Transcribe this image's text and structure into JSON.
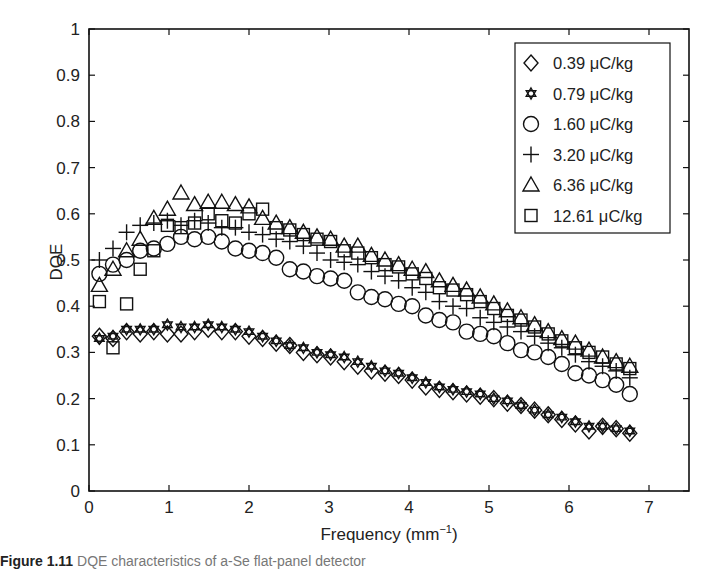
{
  "chart_data": {
    "type": "scatter",
    "title": "",
    "xlabel": "Frequency (mm",
    "xlabel_sup": "−1",
    "xlabel_close": ")",
    "ylabel": "DQE",
    "xlim": [
      0,
      7.5
    ],
    "ylim": [
      0,
      1
    ],
    "xticks": [
      0,
      1,
      2,
      3,
      4,
      5,
      6,
      7
    ],
    "yticks": [
      0,
      0.1,
      0.2,
      0.3,
      0.4,
      0.5,
      0.6,
      0.7,
      0.8,
      0.9,
      1
    ],
    "ytick_labels": [
      "0",
      "0.1",
      "0.2",
      "0.3",
      "0.4",
      "0.5",
      "0.6",
      "0.7",
      "0.8",
      "0.9",
      "1"
    ],
    "grid": false,
    "legend_position": "upper right",
    "x": [
      0.13,
      0.3,
      0.47,
      0.64,
      0.81,
      0.98,
      1.15,
      1.32,
      1.49,
      1.66,
      1.83,
      2.0,
      2.17,
      2.34,
      2.51,
      2.68,
      2.85,
      3.02,
      3.19,
      3.36,
      3.53,
      3.7,
      3.87,
      4.04,
      4.21,
      4.38,
      4.55,
      4.72,
      4.89,
      5.06,
      5.23,
      5.4,
      5.57,
      5.74,
      5.91,
      6.08,
      6.25,
      6.42,
      6.59,
      6.76
    ],
    "series": [
      {
        "name": "0.39 μC/kg",
        "marker": "diamond",
        "values": [
          0.335,
          0.33,
          0.345,
          0.34,
          0.345,
          0.34,
          0.34,
          0.345,
          0.35,
          0.345,
          0.345,
          0.335,
          0.33,
          0.32,
          0.315,
          0.3,
          0.295,
          0.29,
          0.28,
          0.27,
          0.26,
          0.255,
          0.25,
          0.24,
          0.225,
          0.22,
          0.215,
          0.21,
          0.205,
          0.2,
          0.19,
          0.185,
          0.175,
          0.165,
          0.155,
          0.145,
          0.13,
          0.14,
          0.135,
          0.125
        ]
      },
      {
        "name": "0.79 μC/kg",
        "marker": "star",
        "values": [
          0.33,
          0.335,
          0.35,
          0.35,
          0.35,
          0.36,
          0.355,
          0.355,
          0.36,
          0.355,
          0.35,
          0.345,
          0.335,
          0.325,
          0.315,
          0.31,
          0.3,
          0.295,
          0.29,
          0.28,
          0.27,
          0.26,
          0.255,
          0.245,
          0.235,
          0.225,
          0.22,
          0.215,
          0.21,
          0.2,
          0.195,
          0.185,
          0.175,
          0.165,
          0.16,
          0.15,
          0.14,
          0.14,
          0.135,
          0.13
        ]
      },
      {
        "name": "1.60 μC/kg",
        "marker": "circle",
        "values": [
          0.47,
          0.49,
          0.5,
          0.52,
          0.525,
          0.535,
          0.55,
          0.545,
          0.55,
          0.54,
          0.525,
          0.52,
          0.515,
          0.505,
          0.48,
          0.475,
          0.465,
          0.46,
          0.455,
          0.43,
          0.42,
          0.415,
          0.405,
          0.4,
          0.38,
          0.37,
          0.365,
          0.345,
          0.34,
          0.335,
          0.32,
          0.305,
          0.3,
          0.29,
          0.275,
          0.255,
          0.25,
          0.24,
          0.23,
          0.21
        ]
      },
      {
        "name": "3.20 μC/kg",
        "marker": "plus",
        "values": [
          0.5,
          0.525,
          0.56,
          0.575,
          0.58,
          0.585,
          0.575,
          0.585,
          0.58,
          0.57,
          0.57,
          0.56,
          0.555,
          0.545,
          0.54,
          0.53,
          0.515,
          0.5,
          0.495,
          0.49,
          0.475,
          0.465,
          0.455,
          0.44,
          0.43,
          0.41,
          0.4,
          0.395,
          0.375,
          0.365,
          0.355,
          0.345,
          0.335,
          0.32,
          0.31,
          0.295,
          0.28,
          0.27,
          0.26,
          0.245
        ]
      },
      {
        "name": "6.36 μC/kg",
        "marker": "triangle",
        "values": [
          0.445,
          0.48,
          0.52,
          0.545,
          0.59,
          0.61,
          0.645,
          0.62,
          0.625,
          0.625,
          0.62,
          0.615,
          0.59,
          0.58,
          0.57,
          0.56,
          0.55,
          0.545,
          0.53,
          0.53,
          0.51,
          0.5,
          0.49,
          0.48,
          0.475,
          0.455,
          0.445,
          0.435,
          0.42,
          0.405,
          0.39,
          0.375,
          0.36,
          0.345,
          0.33,
          0.32,
          0.305,
          0.29,
          0.28,
          0.27
        ]
      },
      {
        "name": "12.61 μC/kg",
        "marker": "square",
        "values": [
          0.41,
          0.31,
          0.405,
          0.48,
          0.52,
          0.575,
          0.57,
          0.58,
          0.6,
          0.585,
          0.58,
          0.6,
          0.61,
          0.57,
          0.565,
          0.555,
          0.545,
          0.54,
          0.52,
          0.515,
          0.505,
          0.49,
          0.485,
          0.47,
          0.46,
          0.44,
          0.435,
          0.425,
          0.41,
          0.395,
          0.38,
          0.37,
          0.355,
          0.34,
          0.325,
          0.31,
          0.3,
          0.29,
          0.275,
          0.265
        ]
      }
    ]
  },
  "legend": {
    "items": [
      {
        "marker": "diamond",
        "label": "0.39 μC/kg"
      },
      {
        "marker": "star",
        "label": "0.79 μC/kg"
      },
      {
        "marker": "circle",
        "label": "1.60 μC/kg"
      },
      {
        "marker": "plus",
        "label": "3.20 μC/kg"
      },
      {
        "marker": "triangle",
        "label": "6.36 μC/kg"
      },
      {
        "marker": "square",
        "label": "12.61 μC/kg"
      }
    ]
  },
  "caption": {
    "figure_number": "Figure 1.11",
    "text": "DQE characteristics of a-Se flat-panel detector"
  }
}
